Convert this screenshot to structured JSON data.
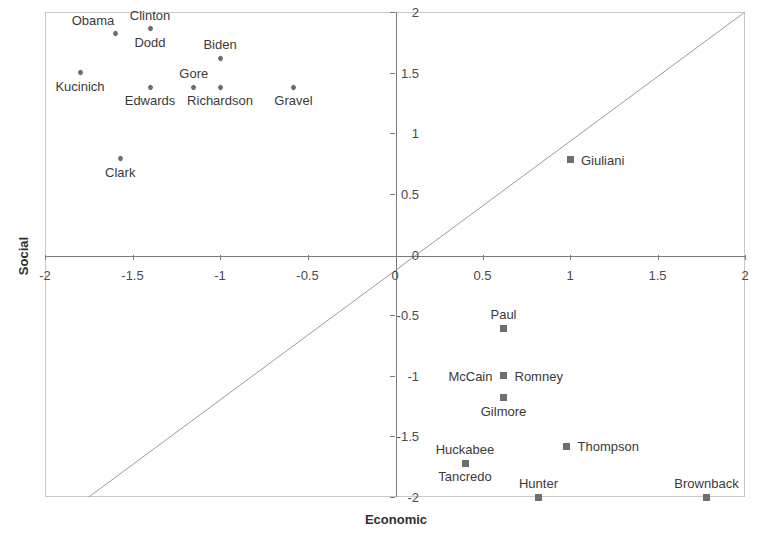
{
  "chart_data": {
    "type": "scatter",
    "title": "",
    "xlabel": "Economic",
    "ylabel": "Social",
    "xlim": [
      -2,
      2
    ],
    "ylim": [
      -2,
      2
    ],
    "grid": false,
    "legend": "none",
    "xticks": [
      "-2",
      "-1.5",
      "-1",
      "-0.5",
      "0",
      "0.5",
      "1",
      "1.5",
      "2"
    ],
    "xtick_values": [
      -2,
      -1.5,
      -1,
      -0.5,
      0,
      0.5,
      1,
      1.5,
      2
    ],
    "yticks": [
      "-2",
      "-1.5",
      "-1",
      "-0.5",
      "0",
      "0.5",
      "1",
      "1.5",
      "2"
    ],
    "ytick_values": [
      -2,
      -1.5,
      -1,
      -0.5,
      0,
      0.5,
      1,
      1.5,
      2
    ],
    "annotations": [
      {
        "text": "diagonal reference line y = x",
        "from": [
          -1.75,
          -2.0
        ],
        "to": [
          2.0,
          2.0
        ]
      }
    ],
    "series": [
      {
        "name": "Democrats",
        "marker": "diamond",
        "color": "#6e6e6e",
        "points": [
          {
            "label": "Obama",
            "x": -1.6,
            "y": 1.82,
            "label_pos": "above-left"
          },
          {
            "label": "Clinton",
            "x": -1.4,
            "y": 1.86,
            "label_pos": "above"
          },
          {
            "label": "Dodd",
            "x": -1.4,
            "y": 1.86,
            "label_pos": "below"
          },
          {
            "label": "Biden",
            "x": -1.0,
            "y": 1.62,
            "label_pos": "above"
          },
          {
            "label": "Kucinich",
            "x": -1.8,
            "y": 1.5,
            "label_pos": "below"
          },
          {
            "label": "Gore",
            "x": -1.15,
            "y": 1.38,
            "label_pos": "above"
          },
          {
            "label": "Edwards",
            "x": -1.4,
            "y": 1.38,
            "label_pos": "below"
          },
          {
            "label": "Richardson",
            "x": -1.0,
            "y": 1.38,
            "label_pos": "below"
          },
          {
            "label": "Gravel",
            "x": -0.58,
            "y": 1.38,
            "label_pos": "below"
          },
          {
            "label": "Clark",
            "x": -1.57,
            "y": 0.79,
            "label_pos": "below"
          }
        ]
      },
      {
        "name": "Republicans",
        "marker": "square",
        "color": "#6e6e6e",
        "points": [
          {
            "label": "Giuliani",
            "x": 1.0,
            "y": 0.78,
            "label_pos": "right"
          },
          {
            "label": "Paul",
            "x": 0.62,
            "y": -0.61,
            "label_pos": "above"
          },
          {
            "label": "Romney",
            "x": 0.62,
            "y": -1.0,
            "label_pos": "right"
          },
          {
            "label": "McCain",
            "x": 0.62,
            "y": -1.0,
            "label_pos": "left"
          },
          {
            "label": "Gilmore",
            "x": 0.62,
            "y": -1.18,
            "label_pos": "below"
          },
          {
            "label": "Thompson",
            "x": 0.98,
            "y": -1.58,
            "label_pos": "right"
          },
          {
            "label": "Huckabee",
            "x": 0.4,
            "y": -1.72,
            "label_pos": "above"
          },
          {
            "label": "Tancredo",
            "x": 0.4,
            "y": -1.72,
            "label_pos": "below"
          },
          {
            "label": "Hunter",
            "x": 0.82,
            "y": -2.0,
            "label_pos": "above"
          },
          {
            "label": "Brownback",
            "x": 1.78,
            "y": -2.0,
            "label_pos": "above"
          }
        ]
      }
    ]
  }
}
